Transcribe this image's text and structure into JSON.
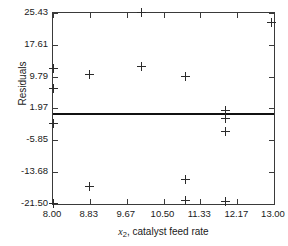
{
  "chart_data": {
    "type": "scatter",
    "title": "",
    "xlabel": "x2, catalyst feed rate",
    "xlabel_base": "x",
    "xlabel_sub": "2",
    "xlabel_rest": ", catalyst feed rate",
    "ylabel": "Residuals",
    "xlim": [
      8.0,
      13.0
    ],
    "ylim": [
      -21.5,
      25.43
    ],
    "grid": false,
    "legend": null,
    "xticks": [
      8.0,
      8.83,
      9.67,
      10.5,
      11.33,
      12.17,
      13.0
    ],
    "xtick_labels": [
      "8.00",
      "8.83",
      "9.67",
      "10.50",
      "11.33",
      "12.17",
      "13.00"
    ],
    "yticks": [
      -21.5,
      -13.68,
      -5.85,
      1.97,
      9.79,
      17.61,
      25.43
    ],
    "ytick_labels": [
      "-21.50",
      "-13.68",
      "-5.85",
      "1.97",
      "9.79",
      "17.61",
      "25.43"
    ],
    "reference_line": {
      "orientation": "horizontal",
      "y": 0.55,
      "color": "#111111",
      "width": 2
    },
    "marker": "plus",
    "marker_color": "#2b2b2b",
    "points": [
      {
        "x": 8.0,
        "y": 11.8
      },
      {
        "x": 8.0,
        "y": 6.85
      },
      {
        "x": 8.0,
        "y": -1.7
      },
      {
        "x": 8.0,
        "y": -21.4
      },
      {
        "x": 8.83,
        "y": 10.3
      },
      {
        "x": 8.83,
        "y": -17.1
      },
      {
        "x": 10.0,
        "y": 25.5
      },
      {
        "x": 10.0,
        "y": 12.2
      },
      {
        "x": 11.0,
        "y": 9.8
      },
      {
        "x": 11.0,
        "y": -15.4
      },
      {
        "x": 11.0,
        "y": -20.6
      },
      {
        "x": 11.9,
        "y": 1.55
      },
      {
        "x": 11.9,
        "y": -0.45
      },
      {
        "x": 11.9,
        "y": -3.8
      },
      {
        "x": 11.9,
        "y": -20.9
      },
      {
        "x": 12.95,
        "y": 23.1
      }
    ]
  }
}
